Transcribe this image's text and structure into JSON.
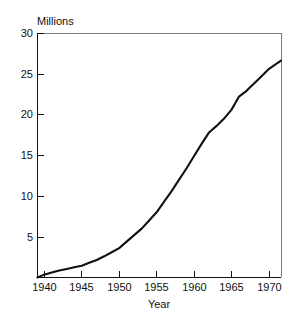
{
  "chart_data": {
    "type": "line",
    "title": "",
    "xlabel": "Year",
    "ylabel": "Millions",
    "ylabel_position": "top-left",
    "xlim": [
      1939.1,
      1971.6
    ],
    "ylim": [
      0,
      30
    ],
    "grid": false,
    "legend": null,
    "frame": "box",
    "line_color": "#111111",
    "background_color": "#ffffff",
    "x_ticks": [
      1940,
      1945,
      1950,
      1955,
      1960,
      1965,
      1970
    ],
    "x_tick_labels": [
      "1940",
      "1945",
      "1950",
      "1955",
      "1960",
      "1965",
      "1970"
    ],
    "y_ticks": [
      5,
      10,
      15,
      20,
      25,
      30
    ],
    "y_tick_labels": [
      "5",
      "10",
      "15",
      "20",
      "25",
      "30"
    ],
    "series": [
      {
        "name": "Millions",
        "x": [
          1939.1,
          1940,
          1941,
          1942,
          1943,
          1944,
          1945,
          1946,
          1947,
          1948,
          1949,
          1950,
          1951,
          1952,
          1953,
          1954,
          1955,
          1956,
          1957,
          1958,
          1959,
          1960,
          1961,
          1962,
          1963,
          1964,
          1965,
          1966,
          1967,
          1968,
          1969,
          1970,
          1971.6
        ],
        "y": [
          0.0,
          0.35,
          0.6,
          0.85,
          1.05,
          1.25,
          1.45,
          1.8,
          2.15,
          2.6,
          3.1,
          3.6,
          4.4,
          5.2,
          6.0,
          7.0,
          8.0,
          9.3,
          10.6,
          12.0,
          13.4,
          14.9,
          16.4,
          17.8,
          18.6,
          19.5,
          20.6,
          22.2,
          22.9,
          23.8,
          24.7,
          25.6,
          26.6
        ]
      }
    ]
  },
  "chart": {
    "y_axis_label": "Millions",
    "x_axis_label": "Year"
  }
}
